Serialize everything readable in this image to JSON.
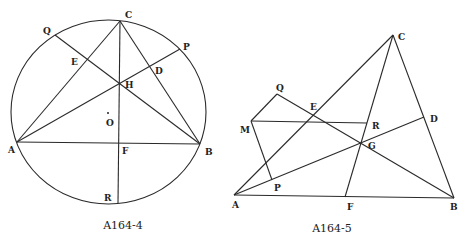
{
  "figures": [
    {
      "id": "fig1",
      "caption": "A164-4",
      "labels": {
        "A": "A",
        "B": "B",
        "C": "C",
        "D": "D",
        "E": "E",
        "F": "F",
        "H": "H",
        "O": "O",
        "P": "P",
        "Q": "Q",
        "R": "R"
      }
    },
    {
      "id": "fig2",
      "caption": "A164-5",
      "labels": {
        "A": "A",
        "B": "B",
        "C": "C",
        "D": "D",
        "E": "E",
        "F": "F",
        "G": "G",
        "M": "M",
        "P": "P",
        "Q": "Q",
        "R": "R"
      }
    }
  ]
}
